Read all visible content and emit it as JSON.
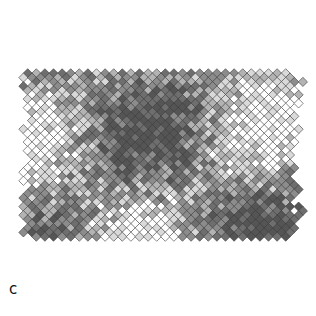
{
  "panel": {
    "label": "c"
  },
  "tiling": {
    "type": "diamond-lattice",
    "center": [
      161,
      155
    ],
    "pitch": 8.6,
    "cell_half": 4.6,
    "extent_half_width": 136,
    "extent_half_height": 143,
    "stroke_color": "#3a3a3a",
    "stroke_width": 0.6,
    "shades": [
      "#ffffff",
      "#d9d9d9",
      "#b3b3b3",
      "#8c8c8c",
      "#6e6e6e",
      "#555555"
    ],
    "background": "#ffffff"
  }
}
